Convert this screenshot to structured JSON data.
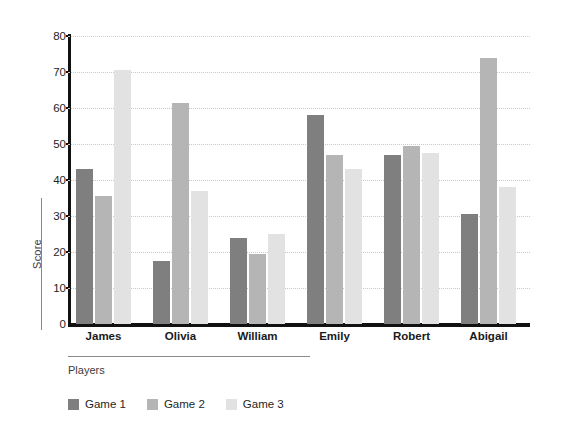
{
  "chart_data": {
    "type": "bar",
    "title": "",
    "xlabel": "Players",
    "ylabel": "Score",
    "categories": [
      "James",
      "Olivia",
      "William",
      "Emily",
      "Robert",
      "Abigail"
    ],
    "series": [
      {
        "name": "Game 1",
        "color": "#7f7f7f",
        "values": [
          43,
          17.5,
          24,
          58,
          47,
          30.5
        ]
      },
      {
        "name": "Game 2",
        "color": "#b5b5b5",
        "values": [
          35.5,
          61.5,
          19.5,
          47,
          49.5,
          74
        ]
      },
      {
        "name": "Game 3",
        "color": "#e2e2e2",
        "values": [
          70.5,
          37,
          25,
          43,
          47.5,
          38
        ]
      }
    ],
    "ylim": [
      0,
      80
    ],
    "yticks": [
      0,
      10,
      20,
      30,
      40,
      50,
      60,
      70,
      80
    ],
    "ytick_labels": [
      "0",
      "10",
      "20",
      "30",
      "40",
      "50",
      "60",
      "70",
      "80"
    ],
    "grid": true,
    "grid_axis": "y",
    "grid_style": "dotted",
    "legend_position": "bottom-left",
    "background_color": "#ffffff",
    "axis_color": "#111111"
  }
}
